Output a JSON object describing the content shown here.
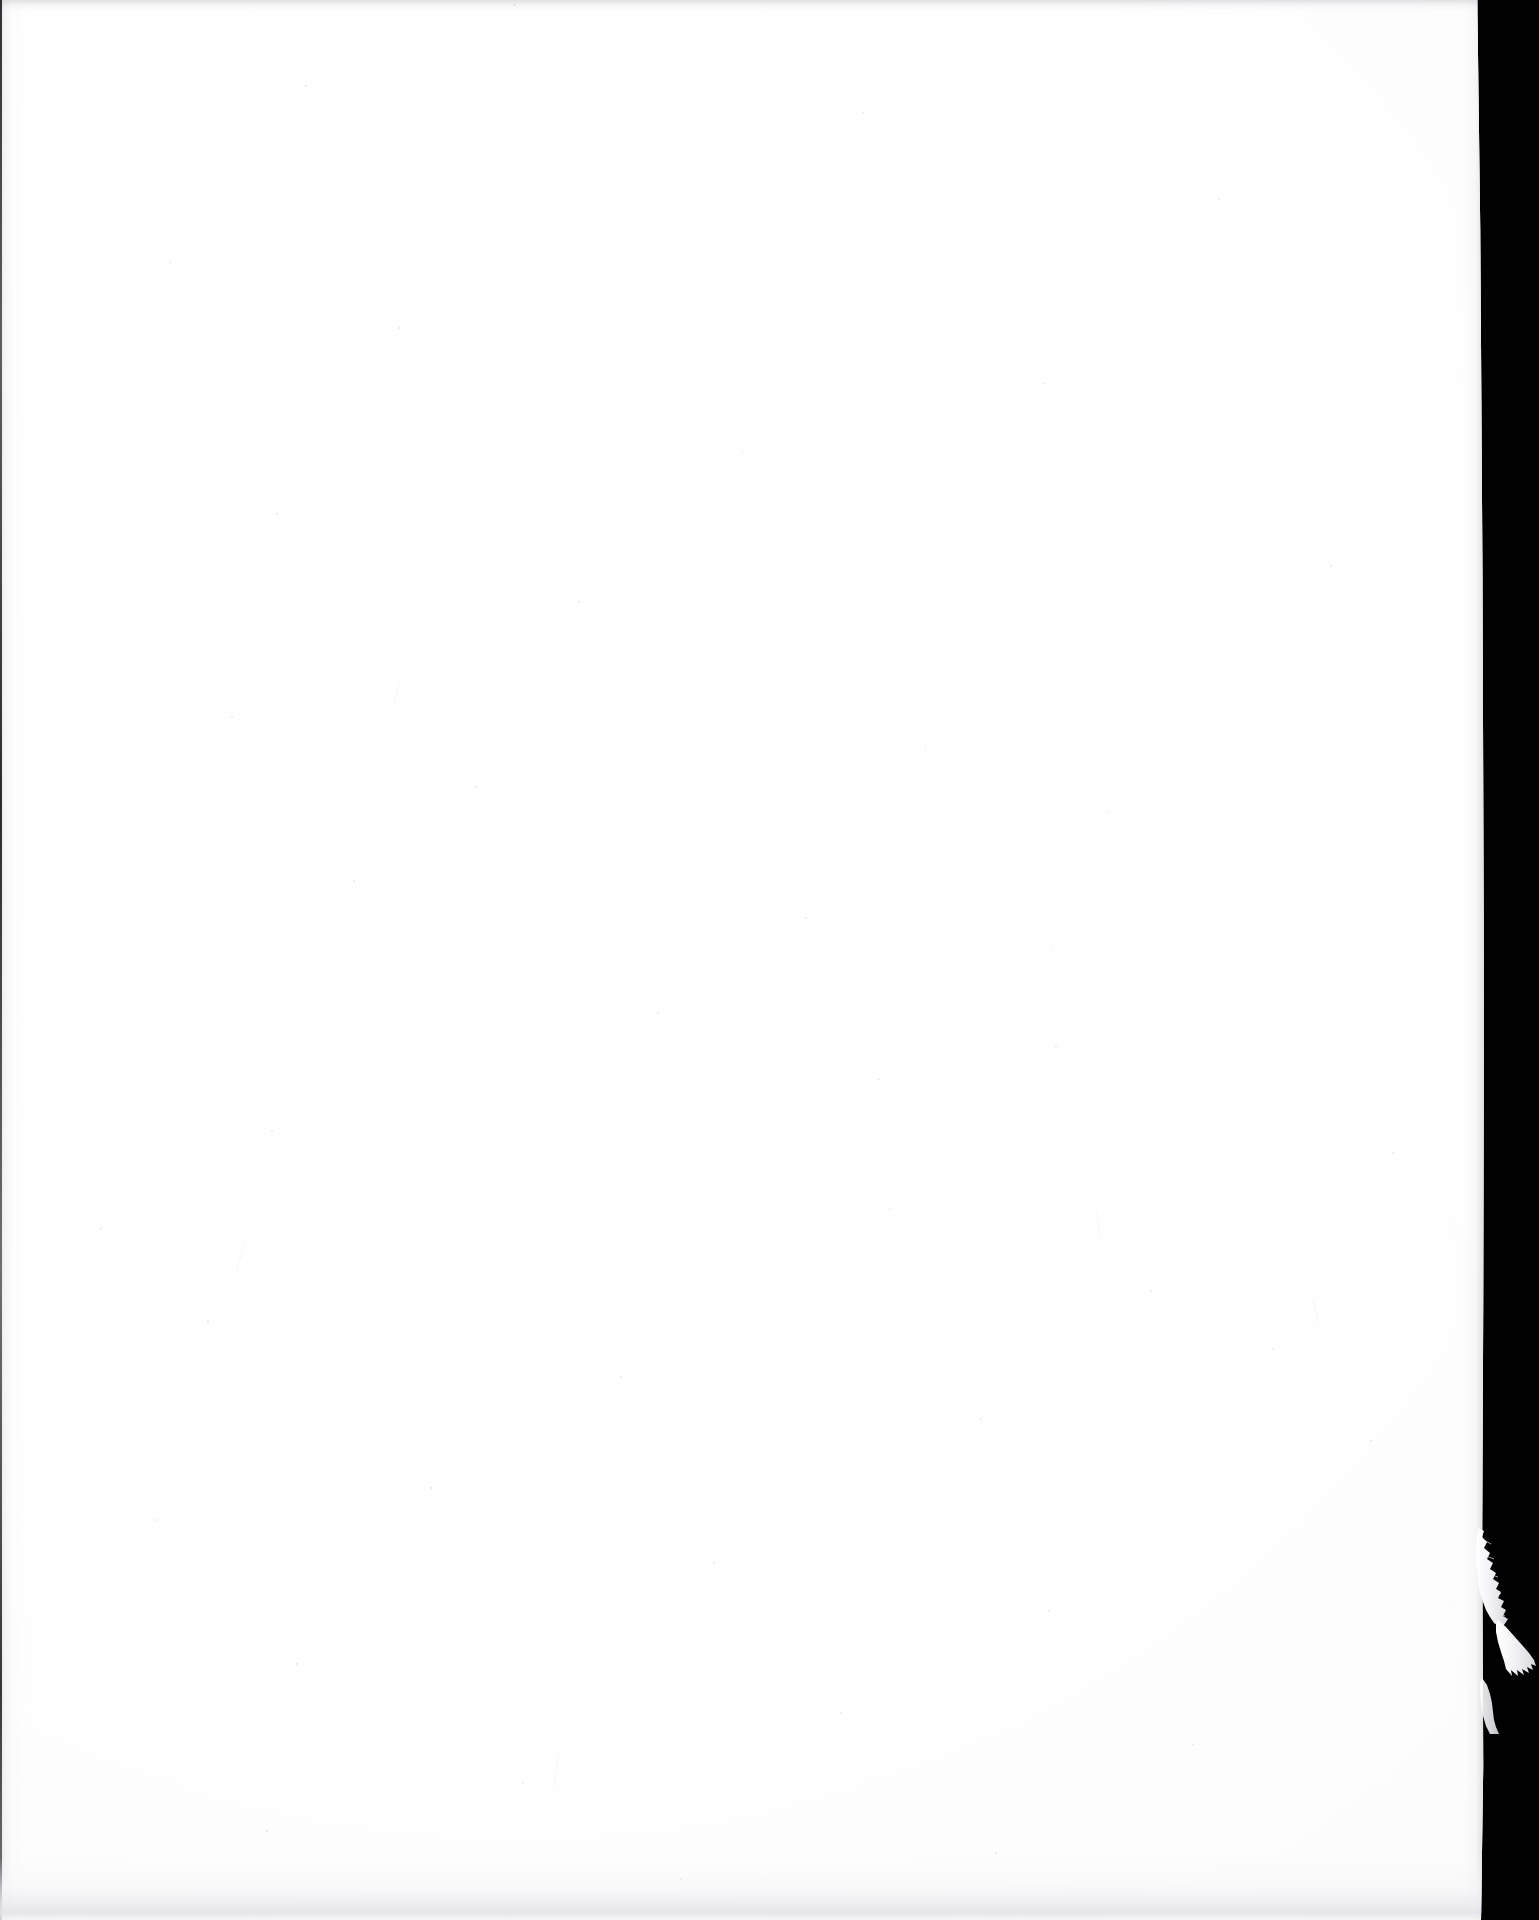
{
  "document": {
    "kind": "scanned-page",
    "page_side": "verso",
    "content_state": "blank",
    "visible_text": "",
    "caption": "",
    "page_number": ""
  },
  "scan": {
    "background_color": "#010101",
    "paper_color": "#fefefe",
    "paper_shadow_color": "#e4e4e9",
    "edge_line_color": "#0a0a0c",
    "speck_color": "#d8d8dc",
    "canvas_width": 1539,
    "canvas_height": 1920,
    "paper_width": 1484,
    "paper_height": 1920,
    "paper_left": 0,
    "paper_top": 0
  },
  "defects": {
    "torn_flap": {
      "label": "torn-paper-flap",
      "edge": "right",
      "top": 1528,
      "bottom": 1734,
      "max_extent_x": 1532,
      "fill_color": "#f2f2f4"
    },
    "specks": [
      {
        "x": 513,
        "y": 4,
        "w": 3,
        "h": 2
      },
      {
        "x": 305,
        "y": 85,
        "w": 2,
        "h": 2
      },
      {
        "x": 862,
        "y": 112,
        "w": 2,
        "h": 1
      },
      {
        "x": 1218,
        "y": 198,
        "w": 2,
        "h": 2
      },
      {
        "x": 170,
        "y": 262,
        "w": 1,
        "h": 2
      },
      {
        "x": 398,
        "y": 327,
        "w": 2,
        "h": 2
      },
      {
        "x": 1043,
        "y": 383,
        "w": 2,
        "h": 1
      },
      {
        "x": 742,
        "y": 452,
        "w": 1,
        "h": 2
      },
      {
        "x": 276,
        "y": 513,
        "w": 2,
        "h": 2
      },
      {
        "x": 1330,
        "y": 565,
        "w": 2,
        "h": 2
      },
      {
        "x": 578,
        "y": 601,
        "w": 2,
        "h": 2
      },
      {
        "x": 231,
        "y": 716,
        "w": 2,
        "h": 2
      },
      {
        "x": 925,
        "y": 748,
        "w": 1,
        "h": 2
      },
      {
        "x": 475,
        "y": 786,
        "w": 2,
        "h": 2
      },
      {
        "x": 1106,
        "y": 812,
        "w": 2,
        "h": 1
      },
      {
        "x": 353,
        "y": 880,
        "w": 2,
        "h": 2
      },
      {
        "x": 805,
        "y": 917,
        "w": 2,
        "h": 2
      },
      {
        "x": 1052,
        "y": 946,
        "w": 1,
        "h": 2
      },
      {
        "x": 657,
        "y": 1012,
        "w": 2,
        "h": 2
      },
      {
        "x": 1055,
        "y": 1045,
        "w": 2,
        "h": 2
      },
      {
        "x": 878,
        "y": 1078,
        "w": 2,
        "h": 2
      },
      {
        "x": 271,
        "y": 1130,
        "w": 2,
        "h": 2
      },
      {
        "x": 1392,
        "y": 1152,
        "w": 2,
        "h": 2
      },
      {
        "x": 889,
        "y": 1207,
        "w": 1,
        "h": 3
      },
      {
        "x": 100,
        "y": 1228,
        "w": 2,
        "h": 2
      },
      {
        "x": 1150,
        "y": 1290,
        "w": 2,
        "h": 2
      },
      {
        "x": 207,
        "y": 1320,
        "w": 2,
        "h": 3
      },
      {
        "x": 1272,
        "y": 1348,
        "w": 2,
        "h": 2
      },
      {
        "x": 620,
        "y": 1376,
        "w": 2,
        "h": 2
      },
      {
        "x": 980,
        "y": 1418,
        "w": 2,
        "h": 2
      },
      {
        "x": 1370,
        "y": 1440,
        "w": 2,
        "h": 2
      },
      {
        "x": 430,
        "y": 1487,
        "w": 2,
        "h": 2
      },
      {
        "x": 156,
        "y": 1519,
        "w": 2,
        "h": 2
      },
      {
        "x": 713,
        "y": 1562,
        "w": 2,
        "h": 2
      },
      {
        "x": 1048,
        "y": 1610,
        "w": 2,
        "h": 2
      },
      {
        "x": 296,
        "y": 1663,
        "w": 2,
        "h": 2
      },
      {
        "x": 840,
        "y": 1712,
        "w": 2,
        "h": 2
      },
      {
        "x": 1192,
        "y": 1744,
        "w": 2,
        "h": 2
      },
      {
        "x": 522,
        "y": 1782,
        "w": 2,
        "h": 2
      },
      {
        "x": 265,
        "y": 1830,
        "w": 3,
        "h": 2
      },
      {
        "x": 995,
        "y": 1852,
        "w": 2,
        "h": 2
      },
      {
        "x": 680,
        "y": 1878,
        "w": 2,
        "h": 2
      }
    ],
    "fibres": [
      {
        "x": 240,
        "y": 1240,
        "w": 1,
        "h": 34,
        "rot": 14
      },
      {
        "x": 1098,
        "y": 1212,
        "w": 1,
        "h": 26,
        "rot": -9
      },
      {
        "x": 556,
        "y": 1756,
        "w": 1,
        "h": 30,
        "rot": 8
      },
      {
        "x": 1315,
        "y": 1300,
        "w": 1,
        "h": 22,
        "rot": -15
      },
      {
        "x": 396,
        "y": 684,
        "w": 1,
        "h": 20,
        "rot": 11
      }
    ]
  }
}
